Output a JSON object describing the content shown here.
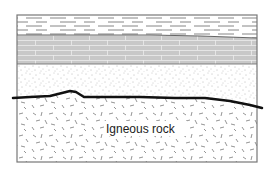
{
  "diagram": {
    "type": "geologic-cross-section",
    "frame": {
      "x": 17,
      "y": 15,
      "width": 240,
      "height": 147
    },
    "layers": [
      {
        "id": "shale",
        "pattern": "horizontal-dashes",
        "fill": "#ffffff",
        "stroke": "#555555",
        "top": 15,
        "bottom_left": 35,
        "bottom_right": 38
      },
      {
        "id": "limestone",
        "pattern": "brick",
        "fill": "#c8c8c8",
        "stroke": "#f2f2f2",
        "top_left": 35,
        "top_right": 38,
        "bottom": 64
      },
      {
        "id": "sandstone",
        "pattern": "stipple",
        "fill": "#ffffff",
        "stroke": "#888888",
        "top": 64
      },
      {
        "id": "igneous",
        "pattern": "random-dashes",
        "fill": "#ffffff",
        "stroke": "#666666",
        "label": "Igneous rock"
      }
    ],
    "unconformity": {
      "stroke": "#111111",
      "width": 2.5,
      "points": [
        [
          13,
          98
        ],
        [
          30,
          97
        ],
        [
          50,
          96
        ],
        [
          62,
          93
        ],
        [
          70,
          91
        ],
        [
          76,
          92
        ],
        [
          84,
          97
        ],
        [
          110,
          97
        ],
        [
          140,
          97
        ],
        [
          175,
          98
        ],
        [
          205,
          98
        ],
        [
          230,
          101
        ],
        [
          250,
          105
        ],
        [
          262,
          108
        ]
      ]
    },
    "labels": {
      "igneous": "Igneous rock"
    },
    "colors": {
      "frame": "#777777",
      "limestone": "#c8c8c8",
      "unconformity": "#111111",
      "text": "#222222"
    }
  }
}
